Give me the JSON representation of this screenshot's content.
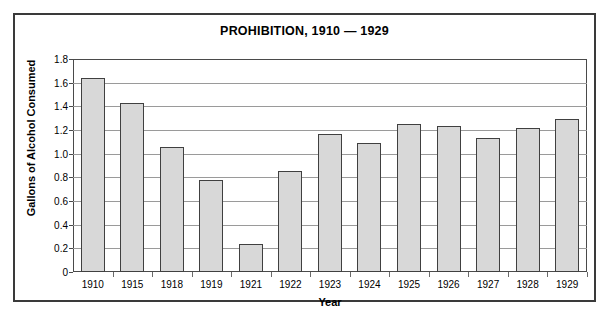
{
  "chart_data": {
    "type": "bar",
    "title": "PROHIBITION, 1910 — 1929",
    "xlabel": "Year",
    "ylabel": "Gallons of Alcohol Consumed",
    "categories": [
      "1910",
      "1915",
      "1918",
      "1919",
      "1921",
      "1922",
      "1923",
      "1924",
      "1925",
      "1926",
      "1927",
      "1928",
      "1929"
    ],
    "values": [
      1.64,
      1.43,
      1.06,
      0.78,
      0.24,
      0.85,
      1.17,
      1.09,
      1.25,
      1.23,
      1.13,
      1.22,
      1.29
    ],
    "ylim": [
      0,
      1.8
    ],
    "yticks": [
      0,
      0.2,
      0.4,
      0.6,
      0.8,
      1.0,
      1.2,
      1.4,
      1.6,
      1.8
    ],
    "ytick_labels": [
      "0",
      "0.2",
      "0.4",
      "0.6",
      "0.8",
      "1.0",
      "1.2",
      "1.4",
      "1.6",
      "1.8"
    ],
    "grid": true,
    "legend": null,
    "bar_color": "#d8d8d8",
    "bar_border_color": "#404040",
    "frame_color": "#3a3a3a",
    "gridline_color": "#9a9a9a"
  }
}
